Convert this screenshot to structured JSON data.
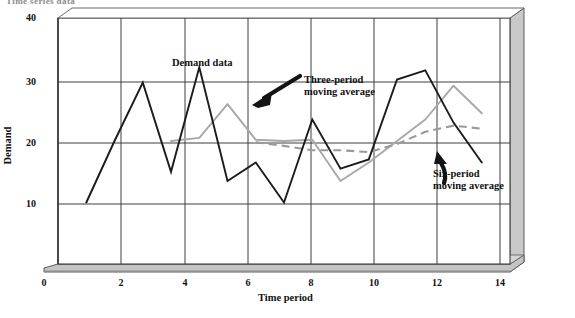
{
  "figure": {
    "clipped_header": "Time series data",
    "background": "#ffffff"
  },
  "axes": {
    "ylabel": "Demand",
    "xlabel": "Time period",
    "y_ticks": [
      "40",
      "30",
      "20",
      "10"
    ],
    "x_ticks": [
      "0",
      "2",
      "4",
      "6",
      "8",
      "10",
      "12",
      "14"
    ],
    "grid": true,
    "frame_style": "3d-block"
  },
  "annotations": {
    "demand": "Demand data",
    "three_period_line1": "Three-period",
    "three_period_line2": "moving average",
    "six_period_line1": "Six-period",
    "six_period_line2": "moving average"
  },
  "colors": {
    "demand_line": "#1b1b1b",
    "three_period_line": "#a8a8a8",
    "six_period_line": "#9a9a9a",
    "grid": "#4a4a4a",
    "frame_face": "#c9c9c9",
    "frame_edge": "#5a5a5a"
  },
  "chart_data": {
    "type": "line",
    "title": "Time series data",
    "xlabel": "Time period",
    "ylabel": "Demand",
    "xlim": [
      0,
      16
    ],
    "ylim": [
      0,
      40
    ],
    "xticks": [
      0,
      2,
      4,
      6,
      8,
      10,
      12,
      14
    ],
    "yticks": [
      10,
      20,
      30,
      40
    ],
    "grid": true,
    "legend": "annotated-inline",
    "x": [
      1,
      2,
      3,
      4,
      5,
      6,
      7,
      8,
      9,
      10,
      11,
      12,
      13,
      14,
      15
    ],
    "series": [
      {
        "name": "Demand data",
        "style": "solid",
        "color": "#1b1b1b",
        "x": [
          1,
          2,
          3,
          4,
          5,
          6,
          7,
          8,
          9,
          10,
          11,
          12,
          13,
          14,
          15
        ],
        "values": [
          10,
          20,
          29.5,
          15,
          32,
          13.5,
          16.5,
          10,
          23.5,
          15.5,
          17,
          30,
          31.5,
          23,
          16.5
        ]
      },
      {
        "name": "Three-period moving average",
        "style": "solid",
        "color": "#a8a8a8",
        "x": [
          4,
          5,
          6,
          7,
          8,
          9,
          10,
          11,
          12,
          13,
          14,
          15
        ],
        "values": [
          20,
          20.5,
          26,
          20.2,
          20,
          20.2,
          13.5,
          16.5,
          20,
          23.5,
          29,
          24.5
        ]
      },
      {
        "name": "Six-period moving average",
        "style": "dashed",
        "color": "#9a9a9a",
        "x": [
          7,
          8,
          9,
          10,
          11,
          12,
          13,
          14,
          15
        ],
        "values": [
          19.8,
          19.2,
          18.5,
          18.5,
          18.2,
          19.5,
          21.5,
          22.5,
          22
        ]
      }
    ]
  }
}
